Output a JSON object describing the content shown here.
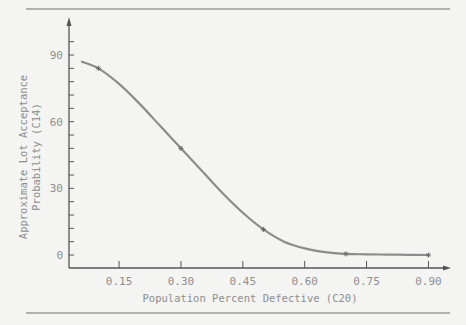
{
  "chart_data": {
    "type": "line",
    "title": "",
    "xlabel": "Population Percent Defective (C20)",
    "ylabel_lines": [
      "Approximate Lot Acceptance",
      "Probability (C14)"
    ],
    "ylabel": "Approximate Lot Acceptance Probability (C14)",
    "xlim": [
      0.03,
      0.93
    ],
    "ylim": [
      -5,
      105
    ],
    "x_ticks": [
      0.15,
      0.3,
      0.45,
      0.6,
      0.75,
      0.9
    ],
    "x_tick_labels": [
      "0.15",
      "0.30",
      "0.45",
      "0.60",
      "0.75",
      "0.90"
    ],
    "y_ticks": [
      0,
      30,
      60,
      90
    ],
    "y_tick_labels": [
      "0",
      "30",
      "60",
      "90"
    ],
    "y_minor_step": 6,
    "grid": false,
    "legend": null,
    "series": [
      {
        "name": "Smoothed OC curve",
        "style": "line",
        "color": "#8c8c8c",
        "x": [
          0.06,
          0.1,
          0.15,
          0.2,
          0.25,
          0.3,
          0.35,
          0.4,
          0.45,
          0.5,
          0.55,
          0.6,
          0.65,
          0.7,
          0.75,
          0.8,
          0.85,
          0.9
        ],
        "y": [
          87,
          84,
          77,
          68,
          58,
          48,
          38,
          28,
          19,
          11.5,
          6,
          3,
          1.3,
          0.5,
          0.3,
          0.2,
          0.1,
          0.0
        ]
      },
      {
        "name": "Data points",
        "style": "marker",
        "marker": "*",
        "color": "#6a6a6a",
        "x": [
          0.1,
          0.3,
          0.5,
          0.7,
          0.9
        ],
        "y": [
          84,
          48,
          11.5,
          0.5,
          0.0
        ]
      }
    ]
  },
  "page": {
    "rule_color": "#6e6e6e",
    "axis_color": "#555555",
    "curve_color": "#8c8c8c"
  }
}
